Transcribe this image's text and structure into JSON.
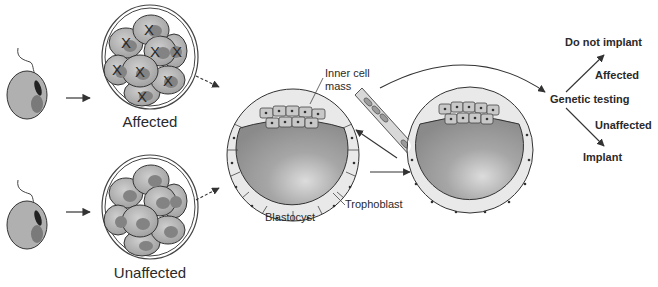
{
  "figure": {
    "colors": {
      "cell_fill": "#b5b5b5",
      "nucleus_fill": "#7c7c7c",
      "outline": "#3a3a3a",
      "trophoblast_fill": "#e8e8e8",
      "cavity_fill": "#9a9a9a",
      "text": "#2a2a2a",
      "arrow": "#333333"
    }
  },
  "embryos": {
    "affected_label": "Affected",
    "unaffected_label": "Unaffected",
    "affected_marker": "X"
  },
  "blastocyst": {
    "inner_cell_mass_line1": "Inner cell",
    "inner_cell_mass_line2": "mass",
    "trophoblast_label": "Trophoblast",
    "blastocyst_label": "Blastocyst"
  },
  "decision": {
    "genetic_testing": "Genetic testing",
    "do_not_implant": "Do not implant",
    "affected": "Affected",
    "unaffected": "Unaffected",
    "implant": "Implant"
  }
}
